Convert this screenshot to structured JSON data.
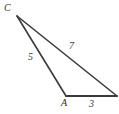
{
  "figure": {
    "kind": "geometry-diagram",
    "shape": "triangle",
    "background_color": "#ffffff",
    "stroke_color": "#3a3a3a",
    "text_color": "#3b3b3b",
    "stroke_width": 1.6,
    "canvas": {
      "width": 119,
      "height": 114
    },
    "vertices": [
      {
        "name": "C",
        "label": "C",
        "x": 17,
        "y": 16,
        "labeled": true,
        "label_x": 4,
        "label_y": 3
      },
      {
        "name": "A",
        "label": "A",
        "x": 66,
        "y": 96,
        "labeled": true,
        "label_x": 61,
        "label_y": 98
      },
      {
        "name": "B",
        "label": "",
        "x": 117,
        "y": 96,
        "labeled": false
      }
    ],
    "sides": [
      {
        "from": "C",
        "to": "A",
        "label": "5",
        "label_x": 28,
        "label_y": 52
      },
      {
        "from": "C",
        "to": "B",
        "label": "7",
        "label_x": 69,
        "label_y": 41
      },
      {
        "from": "A",
        "to": "B",
        "label": "3",
        "label_x": 89,
        "label_y": 99
      }
    ]
  }
}
